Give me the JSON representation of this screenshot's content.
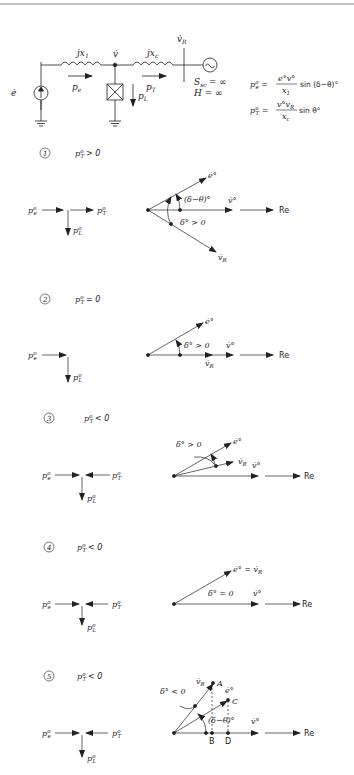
{
  "circuit": {
    "source_label": "ė",
    "x1_label": "jx",
    "x1_sub": "1",
    "xc_label": "jx",
    "xc_sub": "c",
    "node_v_label": "v̇",
    "vr_label": "v̇",
    "vr_sub": "R",
    "pe_label": "p",
    "pe_sub": "e",
    "pt_label": "p",
    "pt_sub": "T",
    "pl_label": "p",
    "pl_sub": "L",
    "ssc_label": "S",
    "ssc_sub": "sc",
    "ssc_value": "= ∞",
    "h_label": "H = ∞"
  },
  "equations": [
    {
      "lhs": "p",
      "lhs_sup": "o",
      "lhs_sub": "e",
      "num": "e°v°",
      "den": "x",
      "den_sub": "1",
      "tail": "sin (δ−θ)°"
    },
    {
      "lhs": "p",
      "lhs_sup": "o",
      "lhs_sub": "T",
      "num": "v°v",
      "num_sub": "R",
      "den": "x",
      "den_sub": "c",
      "tail": "sin θ°"
    }
  ],
  "cases": [
    {
      "number": "1",
      "condition": "> 0",
      "labels": {
        "e": "ė°",
        "v": "v̇°",
        "vr": "v̇",
        "angle1": "(δ−θ)°",
        "angle2": "δ° > 0",
        "re": "Re"
      }
    },
    {
      "number": "2",
      "condition": "= 0",
      "labels": {
        "e": "ė°",
        "v": "v̇°",
        "vr": "v̇",
        "angle1": "δ° > 0",
        "re": "Re"
      }
    },
    {
      "number": "3",
      "condition": "< 0",
      "labels": {
        "e": "ė°",
        "v": "v̇°",
        "vr": "v̇",
        "angle1": "δ° > 0",
        "re": "Re"
      }
    },
    {
      "number": "4",
      "condition": "< 0",
      "labels": {
        "e": "ė° = v̇",
        "v": "v̇°",
        "angle1": "δ° = 0",
        "re": "Re"
      }
    },
    {
      "number": "5",
      "condition": "< 0",
      "labels": {
        "e": "ė°",
        "v": "v̇°",
        "vr": "v̇",
        "angle1": "δ° < 0",
        "angle2": "(δ−θ)°",
        "re": "Re",
        "pA": "A",
        "pB": "B",
        "pC": "C",
        "pD": "D"
      }
    }
  ],
  "common": {
    "p": "p",
    "sup": "o",
    "sub_e": "e",
    "sub_T": "T",
    "sub_L": "L",
    "sub_R": "R"
  }
}
